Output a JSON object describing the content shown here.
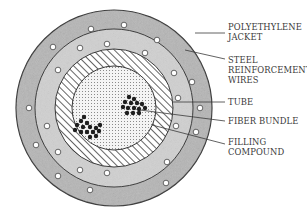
{
  "diagram": {
    "colors": {
      "outline": "#3a3a3a",
      "jacket_fill": "#b5b5b5",
      "inner_ring_fill": "#cfcfcf",
      "tube_hatch": "#555555",
      "filling_dots": "#777777",
      "fiber": "#1e1e1e",
      "wire": "#ffffff"
    },
    "labels": [
      {
        "id": "jacket",
        "lines": [
          "POLYETHYLENE",
          "JACKET"
        ]
      },
      {
        "id": "wires",
        "lines": [
          "STEEL",
          "REINFORCEMENT",
          "WIRES"
        ]
      },
      {
        "id": "tube",
        "lines": [
          "TUBE"
        ]
      },
      {
        "id": "fiber",
        "lines": [
          "FIBER BUNDLE"
        ]
      },
      {
        "id": "filling",
        "lines": [
          "FILLING",
          "COMPOUND"
        ]
      }
    ]
  }
}
